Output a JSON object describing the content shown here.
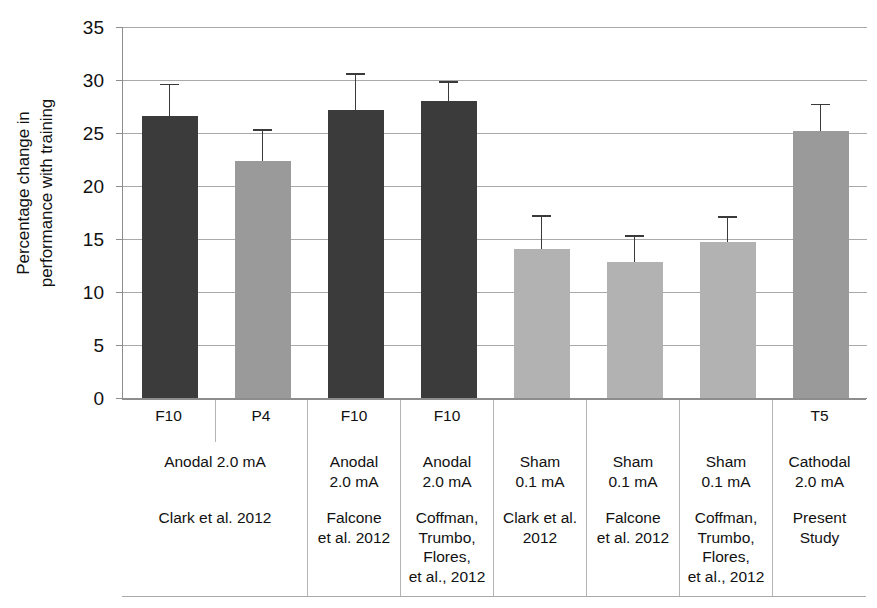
{
  "chart_data": {
    "type": "bar",
    "title": "",
    "xlabel": "",
    "ylabel": "Percentage change in\nperformance with training",
    "ylim": [
      0,
      35
    ],
    "yticks": [
      0,
      5,
      10,
      15,
      20,
      25,
      30,
      35
    ],
    "grid": true,
    "legend": "none",
    "categories": [
      "F10 Anodal 2.0 mA Clark et al. 2012",
      "P4 Anodal 2.0 mA Clark et al. 2012",
      "F10 Anodal 2.0 mA Falcone et al. 2012",
      "F10 Anodal 2.0 mA Coffman, Trumbo, Flores, et al., 2012",
      "Sham 0.1 mA Clark et al. 2012",
      "Sham 0.1 mA Falcone et al. 2012",
      "Sham 0.1 mA Coffman, Trumbo, Flores, et al., 2012",
      "T5 Cathodal 2.0 mA Present Study"
    ],
    "values": [
      26.6,
      22.4,
      27.2,
      28.0,
      14.1,
      12.8,
      14.7,
      25.2
    ],
    "errors_upper": [
      29.5,
      25.2,
      30.5,
      29.7,
      17.1,
      15.2,
      17.0,
      27.6
    ],
    "bar_colors": [
      "#3b3b3b",
      "#9a9a9a",
      "#3b3b3b",
      "#3b3b3b",
      "#b2b2b2",
      "#b2b2b2",
      "#b2b2b2",
      "#9a9a9a"
    ],
    "error_color": "#3a3a3a"
  },
  "axis": {
    "y_title": "Percentage change in\nperformance with training",
    "ticks": [
      "0",
      "5",
      "10",
      "15",
      "20",
      "25",
      "30",
      "35"
    ]
  },
  "label_table": {
    "columns": [
      {
        "electrode": "F10",
        "condition": "",
        "citation": ""
      },
      {
        "electrode": "P4",
        "condition": "",
        "citation": ""
      },
      {
        "electrode": "F10",
        "condition": "Anodal\n2.0 mA",
        "citation": "Falcone\net al. 2012"
      },
      {
        "electrode": "F10",
        "condition": "Anodal\n2.0 mA",
        "citation": "Coffman,\nTrumbo,\nFlores,\net al., 2012"
      },
      {
        "electrode": "",
        "condition": "Sham\n0.1 mA",
        "citation": "Clark et al.\n2012"
      },
      {
        "electrode": "",
        "condition": "Sham\n0.1 mA",
        "citation": "Falcone\net al. 2012"
      },
      {
        "electrode": "",
        "condition": "Sham\n0.1 mA",
        "citation": "Coffman,\nTrumbo,\nFlores,\net al., 2012"
      },
      {
        "electrode": "T5",
        "condition": "Cathodal\n2.0 mA",
        "citation": "Present\nStudy"
      }
    ],
    "merged": {
      "condition": "Anodal 2.0 mA",
      "citation": "Clark et al. 2012"
    }
  }
}
